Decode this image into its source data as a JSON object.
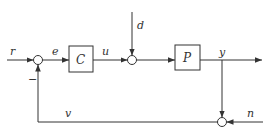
{
  "diagram": {
    "type": "feedback-control-block-diagram",
    "blocks": [
      {
        "id": "C",
        "label": "C"
      },
      {
        "id": "P",
        "label": "P"
      }
    ],
    "signals": {
      "reference": "r",
      "error": "e",
      "control": "u",
      "disturbance": "d",
      "output": "y",
      "noise": "n",
      "feedback": "v"
    },
    "feedback_sign": "−",
    "colors": {
      "line": "#333333",
      "background": "#ffffff"
    }
  }
}
